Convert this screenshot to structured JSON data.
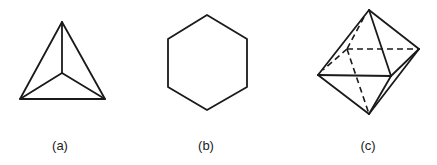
{
  "figures": [
    {
      "id": "a",
      "label": "(a)",
      "shape": "tetrahedron-top-view",
      "label_pos": [
        60,
        138
      ]
    },
    {
      "id": "b",
      "label": "(b)",
      "shape": "hexagon",
      "label_pos": [
        206,
        138
      ]
    },
    {
      "id": "c",
      "label": "(c)",
      "shape": "octahedron",
      "label_pos": [
        368,
        138
      ]
    }
  ],
  "colors": {
    "line": "#1a1a1a",
    "background": "#ffffff",
    "text": "#222222"
  }
}
